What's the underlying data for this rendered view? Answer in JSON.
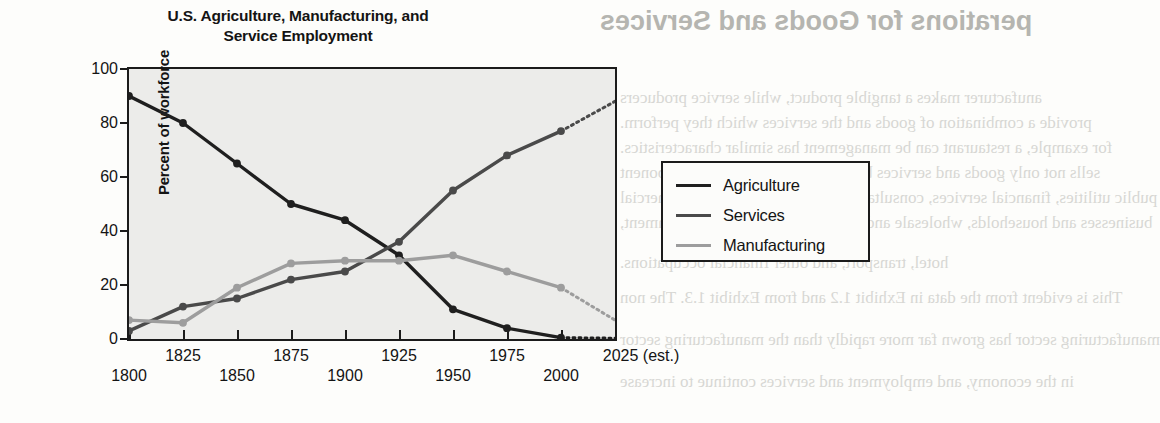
{
  "page": {
    "background_color": "#fdfdfb",
    "bleed_through_text": [
      "perations for Goods and Services",
      "anufacturer makes a tangible product, while service producers",
      "provide a combination of goods and the services which they perform.",
      "for example, a restaurant can be management has similar characteristics.",
      "sells not only goods and services but also about the service component",
      "public utilities, financial services, consultation and maintenance to commercial",
      "businesses and households, wholesale and retail trade, education, government,",
      "hotel, transport, and other financial occupations.",
      "This is evident from the data in Exhibit 1.2 and from Exhibit 1.3. The non",
      "manufacturing sector has grown far more rapidly than the manufacturing sector",
      "in the economy, and employment and services continue to increase"
    ]
  },
  "chart": {
    "title_line1": "U.S. Agriculture, Manufacturing, and",
    "title_line2": "Service Employment",
    "y_axis_title": "Percent of workforce",
    "plot_background": "#ececea",
    "axis_color": "#1b1b1b"
  },
  "legend": {
    "position": "right-outside",
    "entries": [
      {
        "label": "Agriculture",
        "color": "#1f1f1f"
      },
      {
        "label": "Services",
        "color": "#4a4a4a"
      },
      {
        "label": "Manufacturing",
        "color": "#9d9d9d"
      }
    ]
  },
  "chart_data": {
    "type": "line",
    "title": "U.S. Agriculture, Manufacturing, and Service Employment",
    "xlabel": "",
    "ylabel": "Percent of workforce",
    "x": [
      1800,
      1825,
      1850,
      1875,
      1900,
      1925,
      1950,
      1975,
      2000,
      2025
    ],
    "x_tick_labels": [
      "1800",
      "1825",
      "1850",
      "1875",
      "1900",
      "1925",
      "1950",
      "1975",
      "2000",
      "2025 (est.)"
    ],
    "y_tick_labels": [
      "0",
      "20",
      "40",
      "60",
      "80",
      "100"
    ],
    "y_ticks": [
      0,
      20,
      40,
      60,
      80,
      100
    ],
    "ylim": [
      0,
      100
    ],
    "xlim": [
      1800,
      2025
    ],
    "grid": false,
    "legend_position": "right",
    "estimated_from_index": 8,
    "series": [
      {
        "name": "Agriculture",
        "color": "#1f1f1f",
        "values": [
          90,
          80,
          65,
          50,
          44,
          31,
          11,
          4,
          0.5,
          0.3
        ]
      },
      {
        "name": "Services",
        "color": "#4a4a4a",
        "values": [
          3,
          12,
          15,
          22,
          25,
          36,
          55,
          68,
          77,
          88
        ]
      },
      {
        "name": "Manufacturing",
        "color": "#9d9d9d",
        "values": [
          7,
          6,
          19,
          28,
          29,
          29,
          31,
          25,
          19,
          7
        ]
      }
    ]
  }
}
